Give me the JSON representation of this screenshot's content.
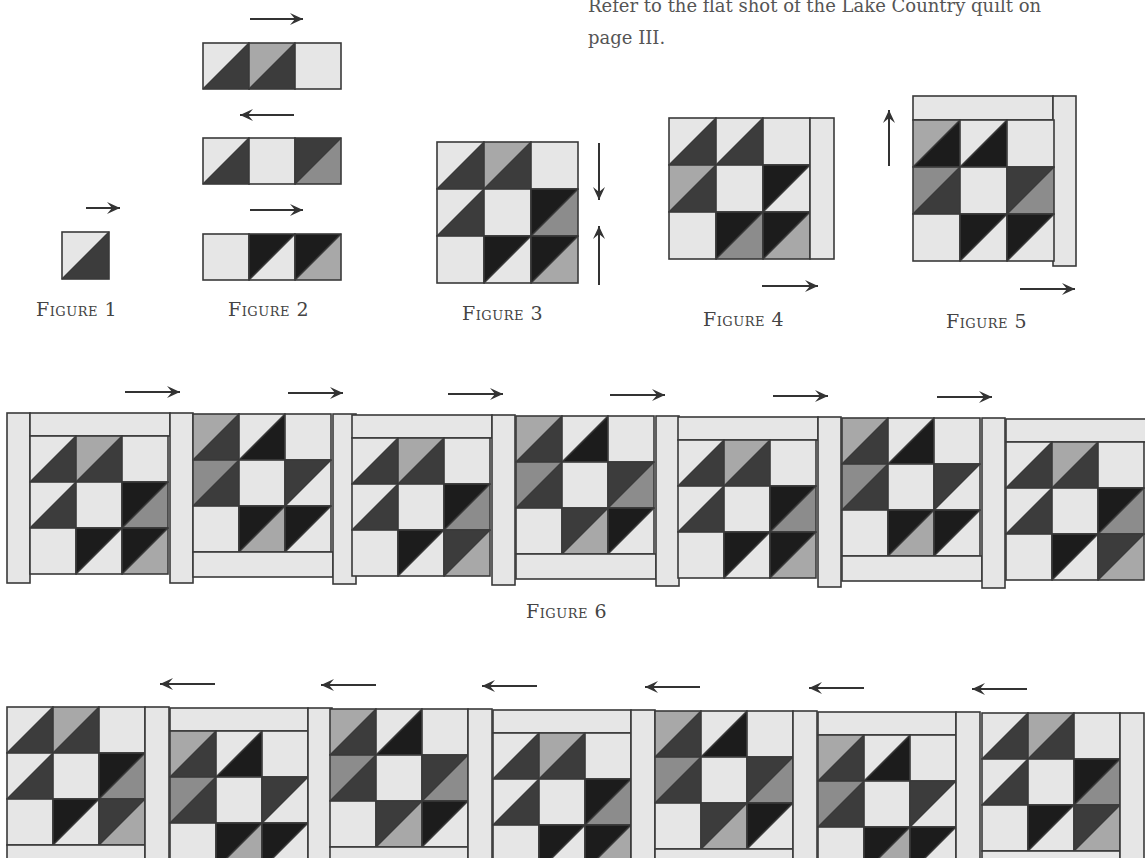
{
  "intro": {
    "line1": "Refer to the flat shot of the Lake Country quilt on",
    "line2": "page III."
  },
  "captions": {
    "fig1": "Figure 1",
    "fig2": "Figure 2",
    "fig3": "Figure 3",
    "fig4": "Figure 4",
    "fig5": "Figure 5",
    "fig6": "Figure 6"
  },
  "colors": {
    "light": "#e6e6e6",
    "medium": "#a8a8a8",
    "mediumDark": "#8c8c8c",
    "dark": "#3c3c3c",
    "black": "#1c1c1c",
    "outline": "#3a3a3a",
    "arrow": "#333333"
  },
  "icons": {
    "arrow_right": "arrow-right-icon",
    "arrow_left": "arrow-left-icon",
    "arrow_up": "arrow-up-icon",
    "arrow_down": "arrow-down-icon"
  },
  "figure6_row": {
    "block_count": 7,
    "arrow_direction": "right"
  },
  "figure7_row": {
    "block_count": 7,
    "arrow_direction": "left"
  }
}
